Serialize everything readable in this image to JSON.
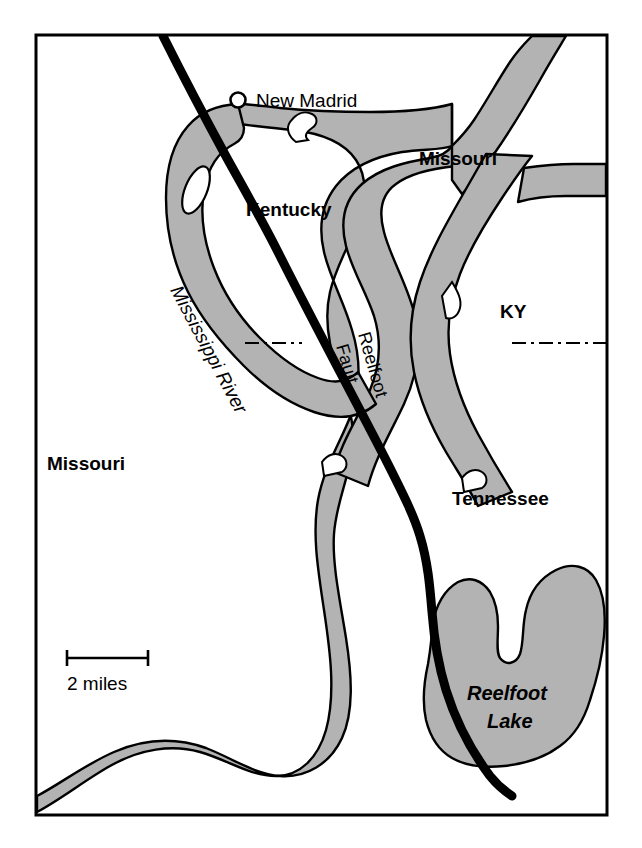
{
  "map": {
    "title": "New Madrid / Reelfoot Fault area map",
    "frame": {
      "x": 36,
      "y": 35,
      "width": 571,
      "height": 780
    },
    "colors": {
      "water_fill": "#b3b3b3",
      "outline": "#000000",
      "fault": "#000000",
      "background": "#ffffff",
      "boundary": "#000000"
    },
    "labels": {
      "city_new_madrid": "New Madrid",
      "state_kentucky": "Kentucky",
      "state_missouri_upper": "Missouri",
      "state_missouri_left": "Missouri",
      "state_ky_abbr": "KY",
      "state_tennessee": "Tennessee",
      "river_name": "Mississippi River",
      "fault_line1": "Reelfoot",
      "fault_line2": "Fault",
      "lake_line1": "Reelfoot",
      "lake_line2": "Lake"
    },
    "scale_bar": {
      "label": "2 miles",
      "x_start": 67,
      "x_end": 148,
      "y": 658
    },
    "city_marker": {
      "name": "new-madrid",
      "cx": 238,
      "cy": 100,
      "r": 7
    },
    "state_boundary": {
      "style": "dash-dot",
      "y": 343,
      "segments": [
        {
          "x_start": 245,
          "x_end": 300
        },
        {
          "x_start": 513,
          "x_end": 607
        }
      ]
    }
  }
}
